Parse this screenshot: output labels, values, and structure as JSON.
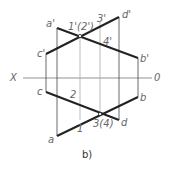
{
  "diagram": {
    "caption": "b)",
    "axis": {
      "left_label": "X",
      "right_label": "0"
    },
    "labels": {
      "a_prime": "a'",
      "b_prime": "b'",
      "c_prime": "c'",
      "d_prime": "d'",
      "p12_prime": "1'(2')",
      "p3_prime": "3'",
      "p4_prime": "4'",
      "a": "a",
      "b": "b",
      "c": "c",
      "d": "d",
      "p1": "1",
      "p2": "2",
      "p34": "3(4)"
    },
    "colors": {
      "line": "#222222",
      "projection": "#999999",
      "label": "#666666"
    }
  }
}
